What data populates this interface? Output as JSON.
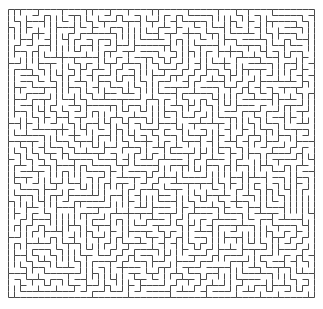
{
  "canvas": {
    "width": 323,
    "height": 309,
    "background_color": "#ffffff"
  },
  "maze": {
    "title": "maze",
    "type": "perfect-maze",
    "algorithm": "randomized-depth-first-search",
    "origin_x": 8,
    "origin_y": 9,
    "cell_size": 6,
    "cols": 51,
    "rows": 48,
    "pixel_width": 306,
    "pixel_height": 288,
    "wall_color": "#4a4a4a",
    "wall_thickness": 1,
    "passage_color": "#ffffff",
    "border_closed": true,
    "entrance": null,
    "exit": null,
    "seed": 20240517
  }
}
